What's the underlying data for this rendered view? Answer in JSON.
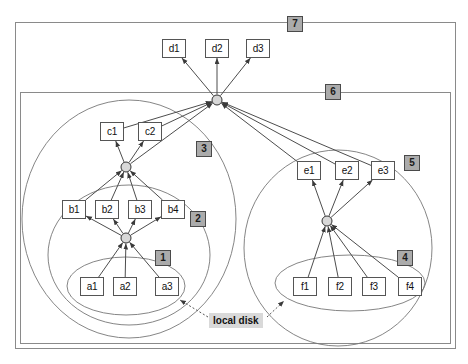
{
  "diagram": {
    "annotation_label": "local disk",
    "colors": {
      "box_border": "#555555",
      "box_fill": "#ffffff",
      "badge_fill": "#ababab",
      "badge_border": "#4a4a4a",
      "hub_fill": "#d8d8d8",
      "hub_border": "#333333",
      "edge": "#4d4d4d",
      "frame": "#8a8a8a",
      "ellipse": "#777777",
      "annotation_fill": "#d9d9d9"
    },
    "frames": [
      {
        "name": "outer-frame",
        "badge": "7",
        "x": 15,
        "y": 22,
        "w": 440,
        "h": 326,
        "badge_x": 287,
        "badge_y": 16
      },
      {
        "name": "inner-frame",
        "badge": "6",
        "x": 20,
        "y": 92,
        "w": 430,
        "h": 251,
        "badge_x": 325,
        "badge_y": 84
      }
    ],
    "groups": [
      {
        "name": "group-1",
        "badge": "1",
        "cx": 126,
        "cy": 286,
        "rx": 59,
        "ry": 29,
        "badge_x": 155,
        "badge_y": 250
      },
      {
        "name": "group-2",
        "badge": "2",
        "cx": 129,
        "cy": 255,
        "rx": 81,
        "ry": 70,
        "badge_x": 190,
        "badge_y": 211
      },
      {
        "name": "group-3",
        "badge": "3",
        "cx": 129,
        "cy": 219,
        "rx": 107,
        "ry": 119,
        "badge_x": 196,
        "badge_y": 141
      },
      {
        "name": "group-4",
        "badge": "4",
        "cx": 350,
        "cy": 283,
        "rx": 75,
        "ry": 28,
        "badge_x": 397,
        "badge_y": 250
      },
      {
        "name": "group-5",
        "badge": "5",
        "cx": 338,
        "cy": 248,
        "rx": 94,
        "ry": 98,
        "badge_x": 404,
        "badge_y": 155
      }
    ],
    "hubs": [
      {
        "name": "hub-top",
        "cx": 217,
        "cy": 100,
        "r": 5
      },
      {
        "name": "hub-c",
        "cx": 126,
        "cy": 167,
        "r": 5
      },
      {
        "name": "hub-b",
        "cx": 126,
        "cy": 238,
        "r": 5
      },
      {
        "name": "hub-right",
        "cx": 327,
        "cy": 221,
        "r": 5
      }
    ],
    "nodes": [
      {
        "id": "d1",
        "label": "d1",
        "x": 162,
        "y": 39
      },
      {
        "id": "d2",
        "label": "d2",
        "x": 205,
        "y": 39
      },
      {
        "id": "d3",
        "label": "d3",
        "x": 246,
        "y": 39
      },
      {
        "id": "c1",
        "label": "c1",
        "x": 100,
        "y": 122
      },
      {
        "id": "c2",
        "label": "c2",
        "x": 138,
        "y": 122
      },
      {
        "id": "b1",
        "label": "b1",
        "x": 62,
        "y": 200
      },
      {
        "id": "b2",
        "label": "b2",
        "x": 95,
        "y": 200
      },
      {
        "id": "b3",
        "label": "b3",
        "x": 128,
        "y": 200
      },
      {
        "id": "b4",
        "label": "b4",
        "x": 161,
        "y": 200
      },
      {
        "id": "a1",
        "label": "a1",
        "x": 80,
        "y": 277
      },
      {
        "id": "a2",
        "label": "a2",
        "x": 113,
        "y": 277
      },
      {
        "id": "a3",
        "label": "a3",
        "x": 155,
        "y": 277
      },
      {
        "id": "e1",
        "label": "e1",
        "x": 297,
        "y": 161
      },
      {
        "id": "e2",
        "label": "e2",
        "x": 335,
        "y": 161
      },
      {
        "id": "e3",
        "label": "e3",
        "x": 371,
        "y": 161
      },
      {
        "id": "f1",
        "label": "f1",
        "x": 293,
        "y": 277
      },
      {
        "id": "f2",
        "label": "f2",
        "x": 328,
        "y": 277
      },
      {
        "id": "f3",
        "label": "f3",
        "x": 362,
        "y": 277
      },
      {
        "id": "f4",
        "label": "f4",
        "x": 398,
        "y": 277
      }
    ],
    "edges": [
      {
        "from": "hub-top",
        "to": "d1"
      },
      {
        "from": "hub-top",
        "to": "d2"
      },
      {
        "from": "hub-top",
        "to": "d3"
      },
      {
        "from": "hub-c",
        "to": "c1"
      },
      {
        "from": "hub-c",
        "to": "c2"
      },
      {
        "from": "hub-b",
        "to": "b1"
      },
      {
        "from": "hub-b",
        "to": "b2"
      },
      {
        "from": "hub-b",
        "to": "b3"
      },
      {
        "from": "hub-b",
        "to": "b4"
      },
      {
        "from": "a1",
        "to": "hub-b"
      },
      {
        "from": "a2",
        "to": "hub-b"
      },
      {
        "from": "a3",
        "to": "hub-b"
      },
      {
        "from": "b1",
        "to": "hub-c"
      },
      {
        "from": "b2",
        "to": "hub-c"
      },
      {
        "from": "b3",
        "to": "hub-c"
      },
      {
        "from": "b4",
        "to": "hub-c"
      },
      {
        "from": "hub-right",
        "to": "e1"
      },
      {
        "from": "hub-right",
        "to": "e2"
      },
      {
        "from": "hub-right",
        "to": "e3"
      },
      {
        "from": "f1",
        "to": "hub-right"
      },
      {
        "from": "f2",
        "to": "hub-right"
      },
      {
        "from": "f3",
        "to": "hub-right"
      },
      {
        "from": "f4",
        "to": "hub-right"
      },
      {
        "from": "c1",
        "to": "hub-top"
      },
      {
        "from": "c2",
        "to": "hub-top"
      },
      {
        "from": "e1",
        "to": "hub-top"
      },
      {
        "from": "e2",
        "to": "hub-top"
      },
      {
        "from": "e3",
        "to": "hub-top"
      },
      {
        "from": "hub-c",
        "to": "hub-top"
      }
    ],
    "annotation_arrows": [
      {
        "name": "disk-arrow-left",
        "x1": 208,
        "y1": 317,
        "x2": 180,
        "y2": 300
      },
      {
        "name": "disk-arrow-right",
        "x1": 267,
        "y1": 317,
        "x2": 284,
        "y2": 301
      }
    ]
  }
}
